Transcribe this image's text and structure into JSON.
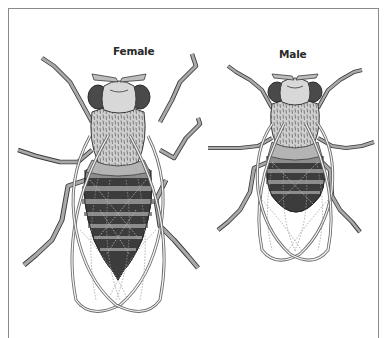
{
  "figure": {
    "labels": {
      "female": "Female",
      "male": "Male"
    },
    "colors": {
      "frame": "#8a8a8a",
      "outline": "#3a3a3a",
      "leg_fill": "#a9a9a9",
      "eye_fill": "#4a4a4a",
      "head_fill": "#d8d8d8",
      "thorax_fill": "#c8c8c8",
      "abdomen_light_band": "#8c8c8c",
      "abdomen_dark_band": "#3c3c3c",
      "wing_outline": "#6a6a6a",
      "wing_vein_dotted": "#9a9a9a"
    },
    "specimens": [
      {
        "id": "female",
        "label": "Female",
        "abdomen_bands": 6,
        "abdomen_tip": "pointed"
      },
      {
        "id": "male",
        "label": "Male",
        "abdomen_bands": 4,
        "abdomen_tip": "rounded, dark"
      }
    ]
  }
}
